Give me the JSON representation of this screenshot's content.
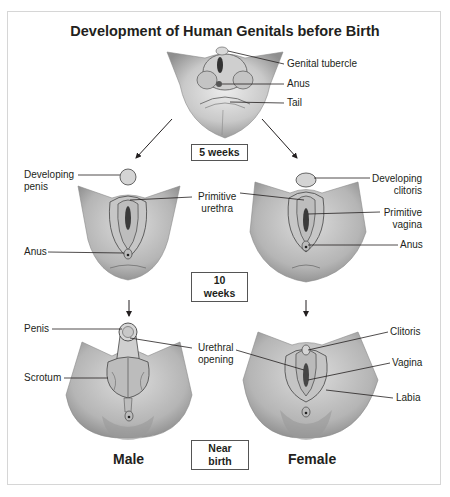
{
  "title": "Development of Human Genitals before Birth",
  "stages": {
    "week5": "5 weeks",
    "week10": "10 weeks",
    "near_birth": "Near birth"
  },
  "top_labels": {
    "genital_tubercle": "Genital tubercle",
    "anus": "Anus",
    "tail": "Tail"
  },
  "male_10wk_labels": {
    "developing_penis_1": "Developing",
    "developing_penis_2": "penis",
    "primitive_urethra_1": "Primitive",
    "primitive_urethra_2": "urethra",
    "anus": "Anus"
  },
  "female_10wk_labels": {
    "developing_clitoris_1": "Developing",
    "developing_clitoris_2": "clitoris",
    "primitive_vagina_1": "Primitive",
    "primitive_vagina_2": "vagina",
    "anus": "Anus"
  },
  "male_birth_labels": {
    "penis": "Penis",
    "scrotum": "Scrotum",
    "urethral_opening_1": "Urethral",
    "urethral_opening_2": "opening"
  },
  "female_birth_labels": {
    "clitoris": "Clitoris",
    "vagina": "Vagina",
    "labia": "Labia"
  },
  "sex_labels": {
    "male": "Male",
    "female": "Female"
  },
  "colors": {
    "text": "#231f20",
    "frame": "#d6d6d6",
    "skin_light": "#e6e6e6",
    "skin_mid": "#b8b8b8",
    "skin_dark": "#7a7a7a"
  }
}
